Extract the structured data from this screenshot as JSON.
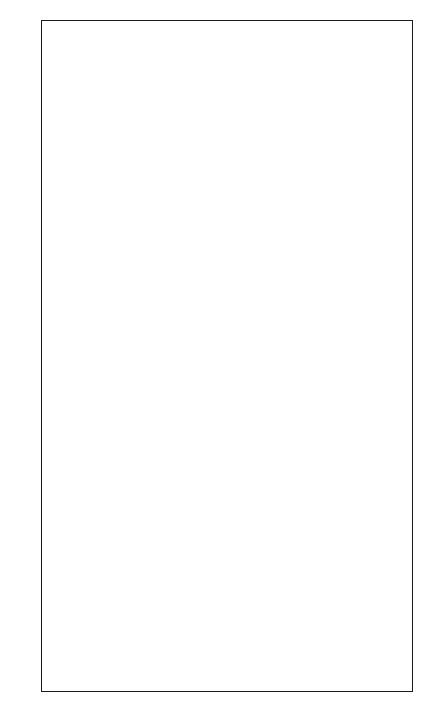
{
  "chart": {
    "columns": 12,
    "rows": 28,
    "colors": {
      "filled": "#9b9b9b",
      "empty": "#f7f7f7",
      "grid_line": "#222222"
    },
    "legend_symbols": {
      "G": "filled",
      "W": "empty",
      "S": "swirl-motif"
    },
    "row_labels_left": [
      "28",
      "26",
      "24",
      "22",
      "20",
      "18",
      "16",
      "14",
      "12",
      "10",
      "8",
      "6",
      "4",
      "2"
    ],
    "row_labels_right": [
      "27",
      "25",
      "23",
      "21",
      "19",
      "17",
      "15",
      "13",
      "11",
      "9",
      "7",
      "5",
      "3",
      "1"
    ],
    "pattern_top_to_bottom": [
      {
        "row": 28,
        "cells": "GGGWGGGGGWGG"
      },
      {
        "row": 27,
        "cells": "GGGWWGGGWWGG"
      },
      {
        "row": 26,
        "cells": "GGGWWWWWWWGG"
      },
      {
        "row": 25,
        "cells": "GGGWWWWWWWGG"
      },
      {
        "row": 24,
        "cells": "GGWWWWWWWWWG"
      },
      {
        "row": 23,
        "cells": "GGWWWSWSWWWG"
      },
      {
        "row": 22,
        "cells": "GGWWWWWWWWWG"
      },
      {
        "row": 21,
        "cells": "GGWWWWSWWWWG"
      },
      {
        "row": 20,
        "cells": "GGGWWWWWWWGG"
      },
      {
        "row": 19,
        "cells": "GGGWWWWWWWGG"
      },
      {
        "row": 18,
        "cells": "GGGGWWWWWGGG"
      },
      {
        "row": 17,
        "cells": "GGGGGWWWGGGG"
      },
      {
        "row": 16,
        "cells": "GGGGWWWWWGGG"
      },
      {
        "row": 15,
        "cells": "GGGWWWWWWWGG"
      },
      {
        "row": 14,
        "cells": "GGWWWWWWWWWG"
      },
      {
        "row": 13,
        "cells": "GWWWWWWWWWWG"
      },
      {
        "row": 12,
        "cells": "GWWWWWWWWWWG"
      },
      {
        "row": 11,
        "cells": "WWWWWWWWWWWW"
      },
      {
        "row": 10,
        "cells": "WWWWWWWWWWWW"
      },
      {
        "row": 9,
        "cells": "WWWWWWWWWWWW"
      },
      {
        "row": 8,
        "cells": "WWWWWWWWWWWW"
      },
      {
        "row": 7,
        "cells": "WWWWWWWWWWWW"
      },
      {
        "row": 6,
        "cells": "WWWWWWWWWWWW"
      },
      {
        "row": 5,
        "cells": "WWWWWWWWWWWW"
      },
      {
        "row": 4,
        "cells": "GWWWWWWWWWWG"
      },
      {
        "row": 3,
        "cells": "GGWWWWWWWWGG"
      },
      {
        "row": 2,
        "cells": "GGWWWWWWWWGG"
      },
      {
        "row": 1,
        "cells": "GGGWWWWWWGGG"
      }
    ],
    "section_divider_after_row": 11,
    "motif_icon": "swirl-icon"
  }
}
